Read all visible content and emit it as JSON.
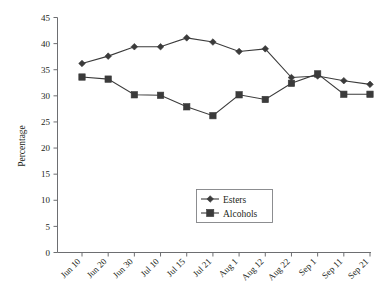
{
  "chart_data": {
    "type": "line",
    "title": "",
    "xlabel": "",
    "ylabel": "Percentage",
    "ylim": [
      0,
      45
    ],
    "yticks": [
      0,
      5,
      10,
      15,
      20,
      25,
      30,
      35,
      40,
      45
    ],
    "grid": false,
    "legend_position": "center-bottom-inside",
    "categories": [
      "Jun 10",
      "Jun 20",
      "Jun 30",
      "Jul 10",
      "Jul 15",
      "Jul 21",
      "Aug 1",
      "Aug 12",
      "Aug 22",
      "Sep 1",
      "Sep 11",
      "Sep 21"
    ],
    "series": [
      {
        "name": "Esters",
        "marker": "diamond",
        "color": "#3b3b3b",
        "values": [
          36.2,
          37.6,
          39.4,
          39.4,
          41.1,
          40.3,
          38.5,
          39.0,
          33.5,
          33.8,
          32.9,
          32.2
        ]
      },
      {
        "name": "Alcohols",
        "marker": "square",
        "color": "#3b3b3b",
        "values": [
          33.6,
          33.2,
          30.2,
          30.1,
          27.9,
          26.2,
          30.2,
          29.3,
          32.4,
          34.2,
          30.3,
          30.3
        ]
      }
    ]
  },
  "legend": {
    "entries": [
      {
        "label": "Esters",
        "marker": "diamond-icon"
      },
      {
        "label": "Alcohols",
        "marker": "square-icon"
      }
    ]
  },
  "axes": {
    "y_title": "Percentage",
    "y_tick_labels": [
      "0",
      "5",
      "10",
      "15",
      "20",
      "25",
      "30",
      "35",
      "40",
      "45"
    ],
    "x_tick_labels": [
      "Jun 10",
      "Jun 20",
      "Jun 30",
      "Jul 10",
      "Jul 15",
      "Jul 21",
      "Aug 1",
      "Aug 12",
      "Aug 22",
      "Sep 1",
      "Sep 11",
      "Sep 21"
    ]
  }
}
